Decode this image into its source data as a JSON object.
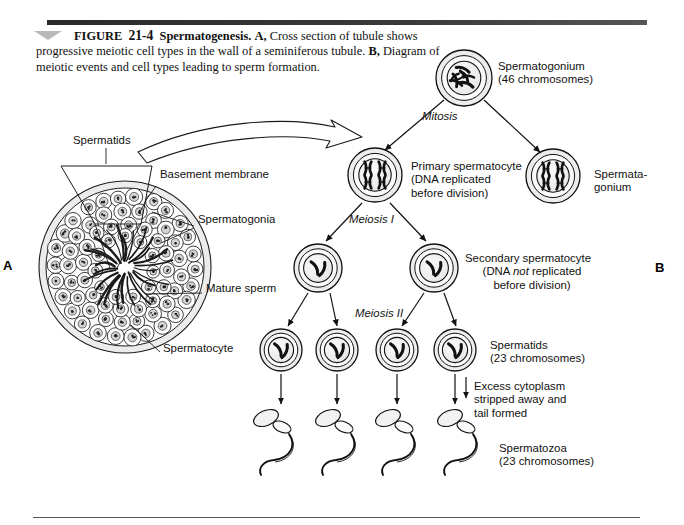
{
  "figure": {
    "rule_color": "#2f2f2f",
    "caption": {
      "figure_word": "FIGURE",
      "number": "21-4",
      "title": "Spermatogenesis.",
      "panel_a_letter": "A,",
      "panel_a_text": "Cross section of tubule shows progressive meiotic cell types in the wall of a seminiferous tubule.",
      "panel_b_letter": "B,",
      "panel_b_text": "Diagram of meiotic events and cell types leading to sperm formation."
    },
    "panel_letters": {
      "a": "A",
      "b": "B"
    }
  },
  "panel_a": {
    "name": "seminiferous-tubule-cross-section",
    "labels": [
      {
        "id": "spermatids",
        "text": "Spermatids",
        "x": 73,
        "y": 140
      },
      {
        "id": "basement-membrane",
        "text": "Basement membrane",
        "x": 160,
        "y": 174
      },
      {
        "id": "spermatogonia",
        "text": "Spermatogonia",
        "x": 198,
        "y": 219
      },
      {
        "id": "mature-sperm",
        "text": "Mature sperm",
        "x": 206,
        "y": 288
      },
      {
        "id": "spermatocyte",
        "text": "Spermatocyte",
        "x": 163,
        "y": 348
      }
    ]
  },
  "panel_b": {
    "name": "meiosis-flow-diagram",
    "cells": [
      {
        "id": "spermatogonium-top",
        "type": "spermatogonium",
        "cx": 464,
        "cy": 78,
        "r": 28,
        "chromosomes": "many"
      },
      {
        "id": "primary-spermatocyte",
        "type": "primary-spermatocyte",
        "cx": 375,
        "cy": 175,
        "r": 27,
        "chromosomes": "4-replicated"
      },
      {
        "id": "spermatogonium-right",
        "type": "spermatogonium",
        "cx": 553,
        "cy": 176,
        "r": 27,
        "chromosomes": "4-replicated"
      },
      {
        "id": "secondary-spermatocyte-1",
        "cx": 318,
        "cy": 268,
        "r": 24,
        "chromosomes": "2"
      },
      {
        "id": "secondary-spermatocyte-2",
        "cx": 434,
        "cy": 268,
        "r": 24,
        "chromosomes": "2"
      },
      {
        "id": "spermatid-1",
        "cx": 281,
        "cy": 350,
        "r": 21,
        "chromosomes": "2"
      },
      {
        "id": "spermatid-2",
        "cx": 337,
        "cy": 350,
        "r": 21,
        "chromosomes": "2"
      },
      {
        "id": "spermatid-3",
        "cx": 397,
        "cy": 350,
        "r": 21,
        "chromosomes": "2"
      },
      {
        "id": "spermatid-4",
        "cx": 455,
        "cy": 350,
        "r": 21,
        "chromosomes": "2"
      }
    ],
    "sperm": [
      {
        "id": "spermatozoon-1",
        "x": 266,
        "y": 418
      },
      {
        "id": "spermatozoon-2",
        "x": 328,
        "y": 418
      },
      {
        "id": "spermatozoon-3",
        "x": 388,
        "y": 418
      },
      {
        "id": "spermatozoon-4",
        "x": 450,
        "y": 418
      }
    ],
    "labels": {
      "spermatogonium": "Spermatogonium\n(46 chromosomes)",
      "mitosis": "Mitosis",
      "primary_spermatocyte": "Primary spermatocyte\n(DNA replicated\nbefore division)",
      "spermatagonium_right": "Spermata-\ngonium",
      "meiosis_i": "Meiosis I",
      "secondary_spermatocyte_l1": "Secondary spermatocyte",
      "secondary_spermatocyte_l2": "(DNA ",
      "secondary_spermatocyte_not": "not",
      "secondary_spermatocyte_l3": " replicated",
      "secondary_spermatocyte_l4": "before division)",
      "meiosis_ii": "Meiosis II",
      "spermatids": "Spermatids\n(23 chromosomes)",
      "excess_cytoplasm": "Excess cytoplasm\nstripped away and\ntail formed",
      "spermatozoa": "Spermatozoa\n(23 chromosomes)"
    }
  }
}
